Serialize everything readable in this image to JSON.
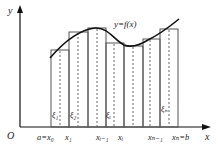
{
  "figure": {
    "type": "riemann-sum-diagram",
    "axes": {
      "y_label": "y",
      "x_label": "x",
      "origin_label": "O"
    },
    "curve_label": "y=f(x)",
    "partition_labels": [
      {
        "key": "x0",
        "text": "a=x₀"
      },
      {
        "key": "x1",
        "text": "x₁"
      },
      {
        "key": "xim1",
        "text": "xᵢ₋₁"
      },
      {
        "key": "xi",
        "text": "xᵢ"
      },
      {
        "key": "xnm1",
        "text": "xₙ₋₁"
      },
      {
        "key": "xn",
        "text": "xₙ=b"
      }
    ],
    "sample_point_labels": [
      {
        "key": "xi1",
        "text": "ξ₁"
      },
      {
        "key": "xi2",
        "text": "ξ₂"
      },
      {
        "key": "xii",
        "text": "ξᵢ"
      },
      {
        "key": "xin",
        "text": "ξₙ"
      }
    ],
    "colors": {
      "curve": "#111111",
      "axes": "#111111",
      "rect_stroke": "#555555",
      "dashed": "#666666"
    }
  }
}
